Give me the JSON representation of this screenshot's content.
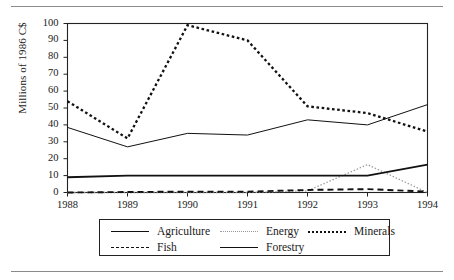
{
  "figure": {
    "has_top_rule": true,
    "has_bottom_rule": true
  },
  "chart_data": {
    "type": "line",
    "title": "",
    "xlabel": "",
    "ylabel": "Millions of 1986 C$",
    "x": [
      1988,
      1989,
      1990,
      1991,
      1992,
      1993,
      1994
    ],
    "xtick_labels": [
      "1988",
      "1989",
      "1990",
      "1991",
      "1992",
      "1993",
      "1994"
    ],
    "ytick_labels": [
      "0",
      "10",
      "20",
      "30",
      "40",
      "50",
      "60",
      "70",
      "80",
      "90",
      "100"
    ],
    "yticks": [
      0,
      10,
      20,
      30,
      40,
      50,
      60,
      70,
      80,
      90,
      100
    ],
    "ylim": [
      0,
      100
    ],
    "xlim": [
      1988,
      1994
    ],
    "grid": false,
    "legend_position": "below-plot",
    "series": [
      {
        "name": "Agriculture",
        "style": "solid-thick",
        "color": "#111111",
        "values": [
          9,
          10,
          10,
          10,
          10,
          10,
          16.5
        ]
      },
      {
        "name": "Energy",
        "style": "fine-dotted",
        "color": "#999999",
        "values": [
          0,
          0,
          0,
          0,
          1,
          16.5,
          0
        ]
      },
      {
        "name": "Minerals",
        "style": "thick-dotted",
        "color": "#111111",
        "values": [
          54,
          32,
          99,
          90,
          51,
          47,
          36
        ]
      },
      {
        "name": "Fish",
        "style": "dashed",
        "color": "#111111",
        "values": [
          0,
          0.3,
          0.5,
          0.5,
          1.5,
          2,
          0.5
        ]
      },
      {
        "name": "Forestry",
        "style": "solid-thin",
        "color": "#111111",
        "values": [
          38.5,
          27,
          35,
          34,
          43,
          40,
          52
        ]
      }
    ]
  },
  "legend": {
    "rows": [
      [
        "Agriculture",
        "Energy",
        "Minerals"
      ],
      [
        "Fish",
        "Forestry"
      ]
    ]
  }
}
